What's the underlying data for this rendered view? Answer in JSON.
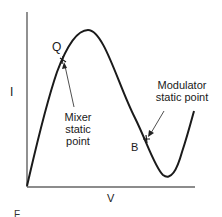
{
  "figure": {
    "axes": {
      "y_label": "I",
      "x_label": "V"
    },
    "points": {
      "Q": {
        "label": "Q",
        "annotation": [
          "Mixer",
          "static",
          "point"
        ]
      },
      "B": {
        "label": "B",
        "annotation": [
          "Modulator",
          "static point"
        ]
      }
    },
    "caption_fragment": "F",
    "colors": {
      "line": "#1a1a1a",
      "axis": "#555555",
      "background": "#ffffff"
    }
  }
}
